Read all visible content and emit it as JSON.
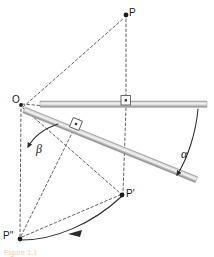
{
  "figure": {
    "kind": "geometry-diagram",
    "background_color": "#ffffff",
    "stroke_color": "#3b3b3b",
    "dash_color": "#555555",
    "bar_light": "#f2f2f2",
    "bar_mid": "#b9b9b9",
    "bar_dark": "#8c8c8c",
    "caption_color": "#e8a45c"
  },
  "labels": {
    "point_P": "P",
    "point_O": "O",
    "point_P_prime": "P'",
    "point_P_double_prime": "P''",
    "angle_alpha": "α",
    "angle_beta": "β",
    "caption": "Figure 1.1"
  },
  "points": {
    "P": {
      "x": 126,
      "y": 14,
      "label": "P"
    },
    "O": {
      "x": 21,
      "y": 104,
      "label": "O"
    },
    "Pp": {
      "x": 122,
      "y": 195,
      "label": "P'"
    },
    "Ppp": {
      "x": 19,
      "y": 239,
      "label": "P''"
    }
  },
  "bars": [
    {
      "name": "horizontal-bar",
      "x1": 40,
      "y1": 104,
      "x2": 207,
      "y2": 104,
      "thickness": 6,
      "angle_deg": 0
    },
    {
      "name": "tilted-bar",
      "x1": 24,
      "y1": 110,
      "x2": 196,
      "y2": 180,
      "thickness": 6,
      "angle_deg": 22
    }
  ],
  "dashed_lines": [
    {
      "name": "O-to-horizontal-bar",
      "x1": 21,
      "y1": 104,
      "x2": 44,
      "y2": 106
    },
    {
      "name": "P-vertical-to-bar",
      "x1": 126,
      "y1": 18,
      "x2": 126,
      "y2": 104
    },
    {
      "name": "P-vertical-to-Pprime",
      "x1": 126,
      "y1": 104,
      "x2": 123,
      "y2": 194
    },
    {
      "name": "O-to-P",
      "x1": 22,
      "y1": 106,
      "x2": 125,
      "y2": 17
    },
    {
      "name": "O-to-Pprime",
      "x1": 22,
      "y1": 107,
      "x2": 121,
      "y2": 193
    },
    {
      "name": "O-to-Pdoubleprime",
      "x1": 21,
      "y1": 108,
      "x2": 20,
      "y2": 237
    },
    {
      "name": "Pdoubleprime-to-tilted-marker",
      "x1": 20,
      "y1": 237,
      "x2": 78,
      "y2": 120
    },
    {
      "name": "Pdoubleprime-to-Pprime-chord",
      "x1": 20,
      "y1": 237,
      "x2": 122,
      "y2": 194
    }
  ],
  "right_angle_markers": [
    {
      "name": "right-angle-on-horizontal-bar",
      "x": 125,
      "y": 100,
      "rotation_deg": 0
    },
    {
      "name": "right-angle-on-tilted-bar",
      "x": 76,
      "y": 124,
      "rotation_deg": -22
    }
  ],
  "arcs": [
    {
      "name": "alpha-arc",
      "description": "arc from right end of horizontal bar down to tilted bar end, arrow at lower end",
      "label": "α",
      "start": {
        "x": 198,
        "y": 108
      },
      "end": {
        "x": 174,
        "y": 178
      },
      "arrow_at": "end"
    },
    {
      "name": "beta-arc",
      "description": "arc near O from lower-left up to the tilted bar, arrow at left end",
      "label": "β",
      "start": {
        "x": 25,
        "y": 148
      },
      "end": {
        "x": 57,
        "y": 125
      },
      "arrow_at": "start"
    },
    {
      "name": "trajectory-arc",
      "description": "arc from P'' sweeping right up to P', arrow mid-arc pointing toward P''",
      "start": {
        "x": 21,
        "y": 240
      },
      "end": {
        "x": 122,
        "y": 196
      },
      "arrow_at": "middle"
    }
  ]
}
